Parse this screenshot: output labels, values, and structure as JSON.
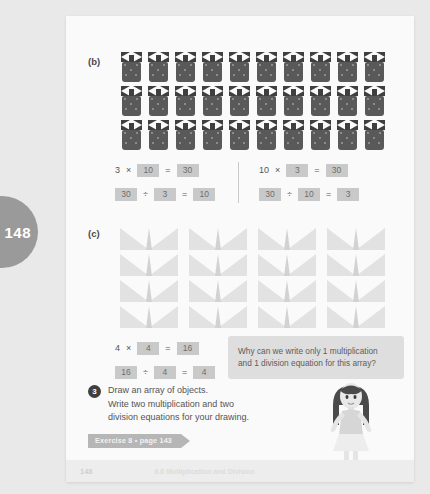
{
  "page": {
    "tab_number": "148",
    "footer_page_number": "148",
    "footer_chapter": "6.6  Multiplication and Division"
  },
  "part_b": {
    "label": "(b)",
    "array": {
      "rows": 3,
      "cols": 10,
      "object": "candy-bag",
      "total": 30
    },
    "equations_left": [
      {
        "id": "mult",
        "tokens": [
          {
            "type": "plain",
            "text": "3"
          },
          {
            "type": "plain",
            "text": "×"
          },
          {
            "type": "box",
            "text": "10"
          },
          {
            "type": "plain",
            "text": "="
          },
          {
            "type": "box",
            "text": "30"
          }
        ]
      },
      {
        "id": "div",
        "tokens": [
          {
            "type": "box",
            "text": "30"
          },
          {
            "type": "plain",
            "text": "÷"
          },
          {
            "type": "box",
            "text": "3"
          },
          {
            "type": "plain",
            "text": "="
          },
          {
            "type": "box",
            "text": "10"
          }
        ]
      }
    ],
    "equations_right": [
      {
        "id": "mult",
        "tokens": [
          {
            "type": "plain",
            "text": "10"
          },
          {
            "type": "plain",
            "text": "×"
          },
          {
            "type": "box",
            "text": "3"
          },
          {
            "type": "plain",
            "text": "="
          },
          {
            "type": "box",
            "text": "30"
          }
        ]
      },
      {
        "id": "div",
        "tokens": [
          {
            "type": "box",
            "text": "30"
          },
          {
            "type": "plain",
            "text": "÷"
          },
          {
            "type": "box",
            "text": "10"
          },
          {
            "type": "plain",
            "text": "="
          },
          {
            "type": "box",
            "text": "3"
          }
        ]
      }
    ]
  },
  "part_c": {
    "label": "(c)",
    "array": {
      "rows": 4,
      "cols": 4,
      "object": "paper-airplane",
      "total": 16
    },
    "equations": [
      {
        "id": "mult",
        "tokens": [
          {
            "type": "plain",
            "text": "4"
          },
          {
            "type": "plain",
            "text": "×"
          },
          {
            "type": "box",
            "text": "4"
          },
          {
            "type": "plain",
            "text": "="
          },
          {
            "type": "box",
            "text": "16"
          }
        ]
      },
      {
        "id": "div",
        "tokens": [
          {
            "type": "box",
            "text": "16"
          },
          {
            "type": "plain",
            "text": "÷"
          },
          {
            "type": "box",
            "text": "4"
          },
          {
            "type": "plain",
            "text": "="
          },
          {
            "type": "box",
            "text": "4"
          }
        ]
      }
    ],
    "speech_bubble": {
      "line1": "Why can we write only 1 multiplication",
      "line2": "and 1 division equation for this array?"
    }
  },
  "question_3": {
    "number": "3",
    "line1": "Draw an array of objects.",
    "line2": "Write two multiplication and two",
    "line3": "division equations for your drawing."
  },
  "exercise_banner": {
    "text": "Exercise 8 • page 143"
  },
  "colors": {
    "page_background": "#fafafa",
    "outer_background": "#e9e9e9",
    "candy_bag": "#595959",
    "airplane": "#e2e2e2",
    "answer_box": "#c9c9c9",
    "speech_bubble": "#dedede",
    "banner": "#b6b6b6",
    "tab": "#9a9a9a"
  }
}
